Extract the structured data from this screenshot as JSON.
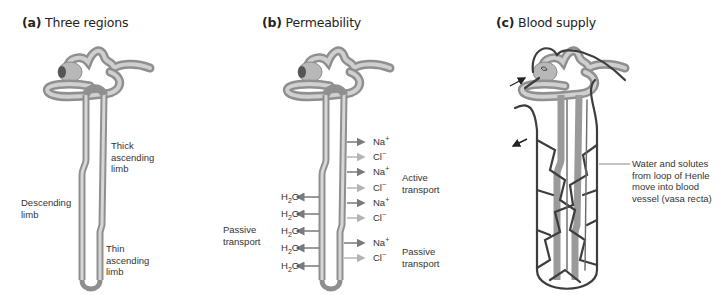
{
  "panels": [
    {
      "letter": "(a)",
      "title": "Three regions",
      "labels": {
        "thick_ascending": [
          "Thick",
          "ascending",
          "limb"
        ],
        "descending": [
          "Descending",
          "limb"
        ],
        "thin_ascending": [
          "Thin",
          "ascending",
          "limb"
        ]
      }
    },
    {
      "letter": "(b)",
      "title": "Permeability",
      "right_ions": [
        "Na+",
        "Cl−",
        "Na+",
        "Cl−",
        "Na+",
        "Cl−",
        "Na+",
        "Cl−"
      ],
      "left_ions": [
        "H2O",
        "H2O",
        "H2O",
        "H2O",
        "H2O"
      ],
      "active_transport": [
        "Active",
        "transport"
      ],
      "passive_transport_left": [
        "Passive",
        "transport"
      ],
      "passive_transport_right": [
        "Passive",
        "transport"
      ]
    },
    {
      "letter": "(c)",
      "title": "Blood supply",
      "annotation": [
        "Water and solutes",
        "from loop of Henle",
        "move into blood",
        "vessel (vasa recta)"
      ]
    }
  ],
  "colors": {
    "tubule": "#9a9a9a",
    "tubule_light": "#d2d2d2",
    "vessel": "#3d3d3d",
    "arrow_dark": "#7a7a7a",
    "arrow_light": "#b4b4b4"
  }
}
